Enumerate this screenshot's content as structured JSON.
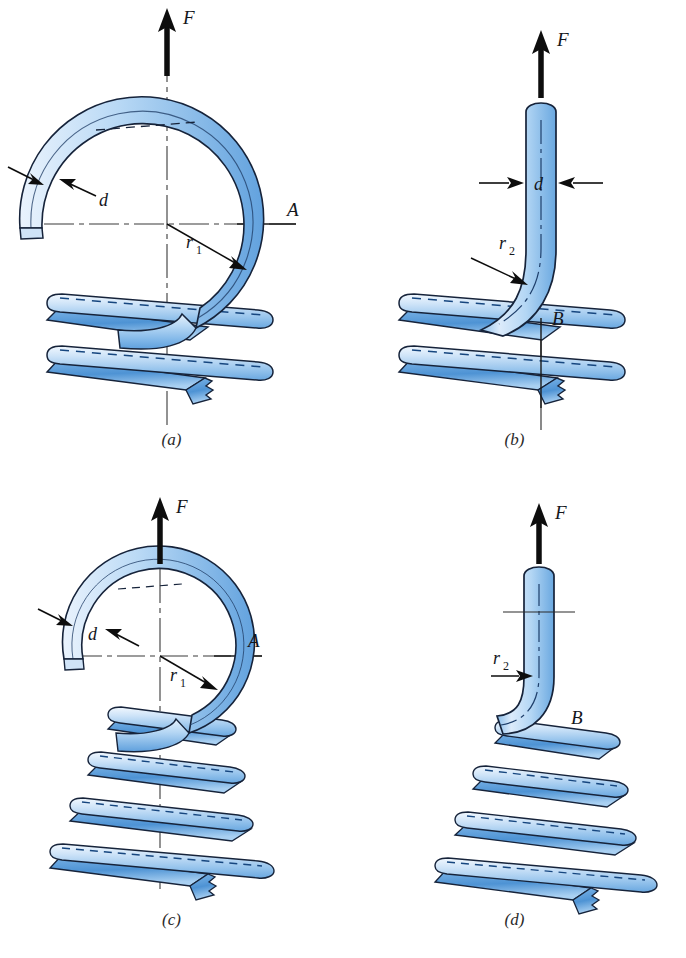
{
  "figure": {
    "background": "#ffffff",
    "width": 686,
    "height": 958
  },
  "colors": {
    "wire_light": "#dceafa",
    "wire_mid": "#9fc9ef",
    "wire_dark": "#4e93d4",
    "wire_deep": "#2f6fb5",
    "outline": "#16233a",
    "ink": "#14161c",
    "centerline": "#3a3a3a"
  },
  "panels": [
    {
      "id": "a",
      "caption": "(a)",
      "force_label": "F",
      "labels": [
        {
          "name": "wire-diameter",
          "text": "d"
        },
        {
          "name": "hook-radius",
          "text": "r",
          "sub": "1"
        },
        {
          "name": "section-a",
          "text": "A"
        }
      ],
      "coil_count": 2,
      "hook_type": "full-loop"
    },
    {
      "id": "b",
      "caption": "(b)",
      "force_label": "F",
      "labels": [
        {
          "name": "wire-diameter",
          "text": "d"
        },
        {
          "name": "bend-radius",
          "text": "r",
          "sub": "2"
        },
        {
          "name": "section-b",
          "text": "B"
        }
      ],
      "coil_count": 2,
      "hook_type": "side-bend"
    },
    {
      "id": "c",
      "caption": "(c)",
      "force_label": "F",
      "labels": [
        {
          "name": "wire-diameter",
          "text": "d"
        },
        {
          "name": "hook-radius",
          "text": "r",
          "sub": "1"
        },
        {
          "name": "section-a",
          "text": "A"
        }
      ],
      "coil_count": 4,
      "hook_type": "full-loop"
    },
    {
      "id": "d",
      "caption": "(d)",
      "force_label": "F",
      "labels": [
        {
          "name": "bend-radius",
          "text": "r",
          "sub": "2"
        },
        {
          "name": "section-b",
          "text": "B"
        }
      ],
      "coil_count": 4,
      "hook_type": "side-bend"
    }
  ]
}
